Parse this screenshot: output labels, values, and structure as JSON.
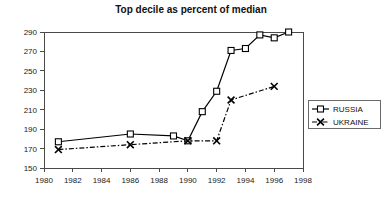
{
  "chart_data": {
    "type": "line",
    "title": "Top decile as percent of median",
    "xlabel": "",
    "ylabel": "",
    "xlim": [
      1980,
      1998
    ],
    "ylim": [
      150,
      290
    ],
    "xticks": [
      1980,
      1982,
      1984,
      1986,
      1988,
      1990,
      1992,
      1994,
      1996,
      1998
    ],
    "yticks": [
      150,
      170,
      190,
      210,
      230,
      250,
      270,
      290
    ],
    "grid": false,
    "legend_position": "right",
    "series": [
      {
        "name": "RUSSIA",
        "marker": "square",
        "linestyle": "solid",
        "color": "#000000",
        "points": [
          {
            "x": 1981,
            "y": 177
          },
          {
            "x": 1986,
            "y": 185
          },
          {
            "x": 1989,
            "y": 183
          },
          {
            "x": 1990,
            "y": 178
          },
          {
            "x": 1991,
            "y": 208
          },
          {
            "x": 1992,
            "y": 229
          },
          {
            "x": 1993,
            "y": 271
          },
          {
            "x": 1994,
            "y": 273
          },
          {
            "x": 1995,
            "y": 287
          },
          {
            "x": 1996,
            "y": 284
          },
          {
            "x": 1997,
            "y": 290
          }
        ]
      },
      {
        "name": "UKRAINE",
        "marker": "x",
        "linestyle": "dashdot",
        "color": "#000000",
        "points": [
          {
            "x": 1981,
            "y": 169
          },
          {
            "x": 1986,
            "y": 174
          },
          {
            "x": 1990,
            "y": 178
          },
          {
            "x": 1992,
            "y": 178
          },
          {
            "x": 1993,
            "y": 220
          },
          {
            "x": 1996,
            "y": 234
          }
        ]
      }
    ]
  },
  "legend": {
    "entries": [
      {
        "label": "RUSSIA"
      },
      {
        "label": "UKRAINE"
      }
    ]
  }
}
